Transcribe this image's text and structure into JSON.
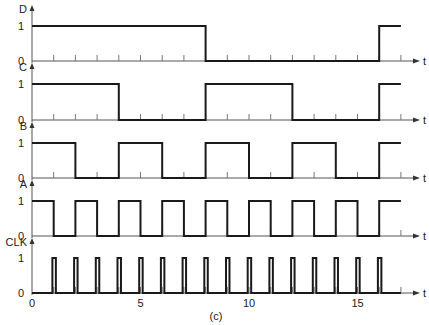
{
  "figure": {
    "caption": "(c)",
    "time_axis_label": "t",
    "x_tick_labels": [
      {
        "t": 0,
        "text": "0"
      },
      {
        "t": 5,
        "text": "5"
      },
      {
        "t": 10,
        "text": "10"
      },
      {
        "t": 15,
        "text": "15"
      }
    ],
    "t_min": 0,
    "t_max": 17,
    "high_label": "1",
    "low_label": "0"
  },
  "signals": [
    {
      "name": "D",
      "type": "square",
      "initial": 1,
      "transitions": [
        8,
        16
      ],
      "end": 17
    },
    {
      "name": "C",
      "type": "square",
      "initial": 1,
      "transitions": [
        4,
        8,
        12,
        16
      ],
      "end": 17
    },
    {
      "name": "B",
      "type": "square",
      "initial": 1,
      "transitions": [
        2,
        4,
        6,
        8,
        10,
        12,
        14,
        16
      ],
      "end": 17
    },
    {
      "name": "A",
      "type": "square",
      "initial": 1,
      "transitions": [
        1,
        2,
        3,
        4,
        5,
        6,
        7,
        8,
        9,
        10,
        11,
        12,
        13,
        14,
        15,
        16
      ],
      "end": 17
    },
    {
      "name": "CLK",
      "type": "pulse",
      "initial": 0,
      "pulses_at": [
        1,
        2,
        3,
        4,
        5,
        6,
        7,
        8,
        9,
        10,
        11,
        12,
        13,
        14,
        15,
        16
      ],
      "pulse_width": 0.16,
      "end": 17
    }
  ],
  "layout": {
    "x0": 32,
    "unit": 21.7,
    "axis_end_x": 420,
    "rows": [
      {
        "high_y": 26,
        "low_y": 61,
        "top_y": 5
      },
      {
        "high_y": 84,
        "low_y": 120,
        "top_y": 63
      },
      {
        "high_y": 143,
        "low_y": 178,
        "top_y": 122
      },
      {
        "high_y": 201,
        "low_y": 236,
        "top_y": 180
      },
      {
        "high_y": 258,
        "low_y": 293,
        "top_y": 238
      }
    ]
  },
  "colors": {
    "waveform": "#1a1a1a",
    "axis": "#555555",
    "background": "#ffffff"
  }
}
